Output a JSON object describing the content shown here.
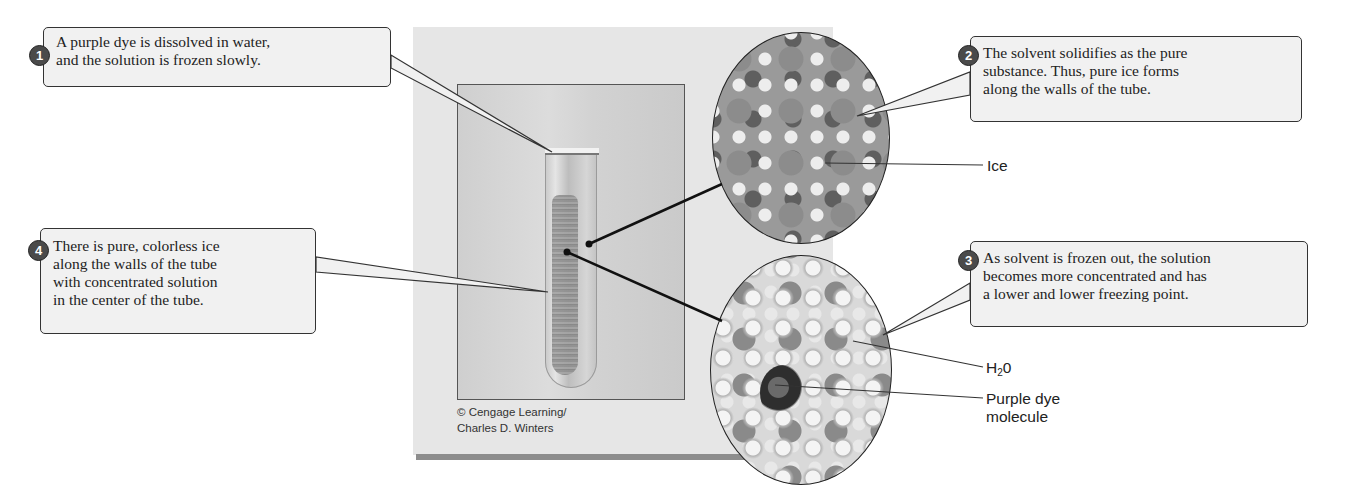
{
  "figure": {
    "callouts": [
      {
        "number": "1",
        "text": "A purple dye is dissolved in water,\nand the solution is frozen slowly."
      },
      {
        "number": "2",
        "text": "The solvent solidifies as the pure\nsubstance. Thus, pure ice forms\nalong the walls of the tube."
      },
      {
        "number": "3",
        "text": "As solvent is frozen out, the solution\nbecomes more concentrated and has\na lower and lower freezing point."
      },
      {
        "number": "4",
        "text": "There is pure, colorless ice\nalong the walls of the tube\nwith concentrated solution\nin the center of the tube."
      }
    ],
    "labels": {
      "ice": "Ice",
      "h2o_main": "H",
      "h2o_sub": "2",
      "h2o_tail": "0",
      "purple_dye": "Purple dye\nmolecule"
    },
    "credit": "© Cengage Learning/\nCharles D. Winters",
    "images": {
      "photo": "test-tube-frozen-dye-photo",
      "magnified_top": "ice-lattice-molecular-view",
      "magnified_bottom": "concentrated-solution-molecular-view"
    },
    "colors": {
      "callout_bg": "#f1f1f1",
      "callout_border": "#333333",
      "badge_bg": "#4a4a4a",
      "panel_bg": "#e6e6e6"
    }
  }
}
